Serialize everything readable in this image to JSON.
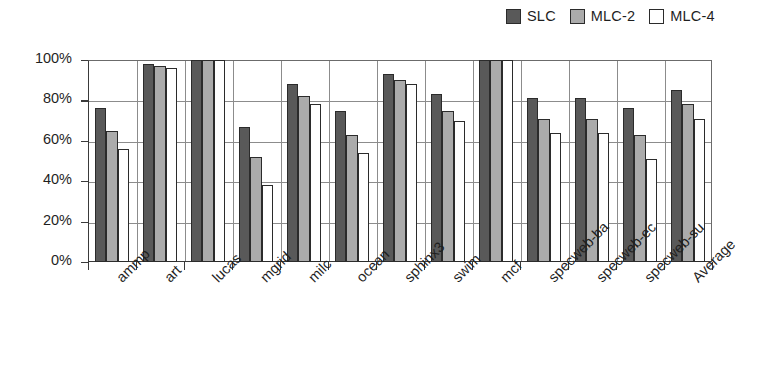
{
  "chart_data": {
    "type": "bar",
    "title": "",
    "xlabel": "",
    "ylabel": "",
    "ylim": [
      0,
      100
    ],
    "ytick_labels": [
      "100%",
      "80%",
      "60%",
      "40%",
      "20%",
      "0%"
    ],
    "ytick_values": [
      100,
      80,
      60,
      40,
      20,
      0
    ],
    "grid": true,
    "legend_position": "top-right",
    "categories": [
      "ammp",
      "art",
      "lucas",
      "mgrid",
      "milc",
      "ocean",
      "sphinx3",
      "swim",
      "mcf",
      "specweb-ba",
      "specweb-ec",
      "specweb-su",
      "Average"
    ],
    "series": [
      {
        "name": "SLC",
        "color": "#595959",
        "values": [
          76,
          98,
          100,
          67,
          88,
          75,
          93,
          83,
          100,
          81,
          81,
          76,
          85
        ]
      },
      {
        "name": "MLC-2",
        "color": "#ababab",
        "values": [
          65,
          97,
          100,
          52,
          82,
          63,
          90,
          75,
          100,
          71,
          71,
          63,
          78
        ]
      },
      {
        "name": "MLC-4",
        "color": "#ffffff",
        "values": [
          56,
          96,
          100,
          38,
          78,
          54,
          88,
          70,
          100,
          64,
          64,
          51,
          71
        ]
      }
    ]
  },
  "legend": {
    "entries": [
      {
        "label": "SLC",
        "swatch": "dark-gray-swatch"
      },
      {
        "label": "MLC-2",
        "swatch": "medium-gray-swatch"
      },
      {
        "label": "MLC-4",
        "swatch": "white-swatch"
      }
    ]
  }
}
